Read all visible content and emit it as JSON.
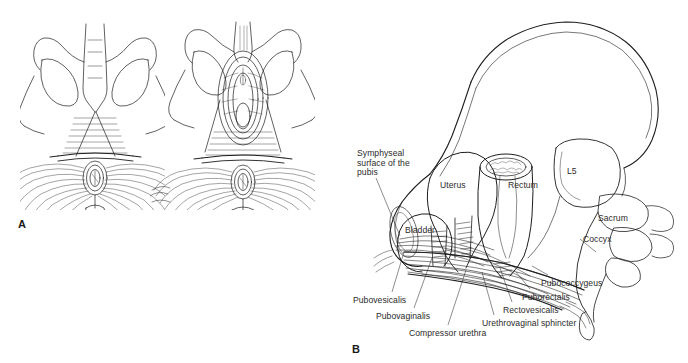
{
  "figure": {
    "background_color": "#ffffff",
    "line_color": "#1a1a1a",
    "label_color": "#2b2b2b",
    "width": 688,
    "height": 363
  },
  "panels": [
    {
      "letter": "A",
      "description": "Two perineal-view line drawings of the female pelvic outlet showing superficial and deep perineal musculature",
      "letter_x": 18,
      "letter_y": 218
    },
    {
      "letter": "B",
      "description": "Oblique three-quarter cutaway view of the female pelvis showing the pelvic floor muscles, bladder, uterus and rectum",
      "letter_x": 352,
      "letter_y": 343
    }
  ],
  "labels": [
    {
      "id": "symphyseal-surface-of-the-pubis",
      "text": "Symphyseal\nsurface of the\npubis",
      "x": 357,
      "y": 149,
      "align": "left"
    },
    {
      "id": "uterus",
      "text": "Uterus",
      "x": 440,
      "y": 181,
      "align": "left"
    },
    {
      "id": "rectum",
      "text": "Rectum",
      "x": 508,
      "y": 181,
      "align": "left"
    },
    {
      "id": "l5",
      "text": "L5",
      "x": 567,
      "y": 167,
      "align": "left"
    },
    {
      "id": "sacrum",
      "text": "Sacrum",
      "x": 598,
      "y": 214,
      "align": "left"
    },
    {
      "id": "coccyx",
      "text": "Coccyx",
      "x": 583,
      "y": 235,
      "align": "left"
    },
    {
      "id": "bladder",
      "text": "Bladder",
      "x": 405,
      "y": 226,
      "align": "left"
    },
    {
      "id": "pubococcygeus",
      "text": "Pubococcygeus",
      "x": 541,
      "y": 279,
      "align": "left"
    },
    {
      "id": "puborectalis",
      "text": "Puborectalis",
      "x": 522,
      "y": 293,
      "align": "left"
    },
    {
      "id": "rectovesicalis",
      "text": "Rectovesicalis",
      "x": 503,
      "y": 306,
      "align": "left"
    },
    {
      "id": "urethrovaginal-sphincter",
      "text": "Urethrovaginal sphincter",
      "x": 482,
      "y": 319,
      "align": "left"
    },
    {
      "id": "pubovesicalis",
      "text": "Pubovesicalis",
      "x": 353,
      "y": 296,
      "align": "left"
    },
    {
      "id": "pubovaginalis",
      "text": "Pubovaginalis",
      "x": 376,
      "y": 312,
      "align": "left"
    },
    {
      "id": "compressor-urethra",
      "text": "Compressor urethra",
      "x": 409,
      "y": 329,
      "align": "left"
    }
  ]
}
